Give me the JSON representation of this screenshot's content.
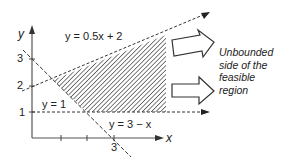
{
  "diagram": {
    "title": "",
    "axes": {
      "x_label": "x",
      "y_label": "y",
      "y_ticks": [
        "1",
        "2",
        "3"
      ],
      "x_ticks": [
        "3"
      ]
    },
    "lines": [
      {
        "id": "line-top",
        "label": "y = 0.5x + 2",
        "style": "dashed"
      },
      {
        "id": "line-bottom",
        "label": "y = 1",
        "style": "dashed"
      },
      {
        "id": "line-diagonal",
        "label": "y = 3 − x",
        "style": "dashed"
      }
    ],
    "region": {
      "label_lines": [
        "Unbounded",
        "side of the",
        "feasible",
        "region"
      ],
      "fill": "hatched",
      "color": "#333333"
    }
  }
}
